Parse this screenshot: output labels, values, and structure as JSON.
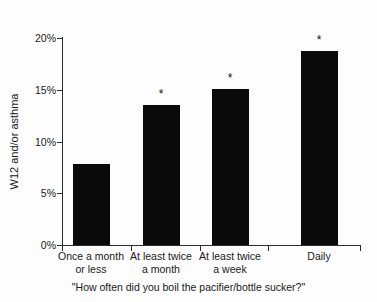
{
  "chart_data": {
    "type": "bar",
    "title": "",
    "subtitle": "",
    "categories": [
      "Once a month\nor less",
      "At least twice\na month",
      "At least twice\na week",
      "Daily"
    ],
    "values": [
      7.8,
      13.5,
      15.1,
      18.7
    ],
    "value_labels": [
      "7.8%",
      "13.5%",
      "15.1%",
      "18.7%"
    ],
    "annotations": [
      "",
      "*",
      "*",
      "*"
    ],
    "xlabel": "\"How often did you boil the pacifier/bottle sucker?\"",
    "ylabel": "W12 and/or asthma",
    "ylim": [
      0,
      20
    ],
    "yticks": [
      0,
      5,
      10,
      15,
      20
    ],
    "ytick_labels": [
      "0%",
      "5%",
      "10%",
      "15%",
      "20%"
    ],
    "grid": false,
    "legend": "none",
    "bar_color": "#0a0a0a",
    "axis_color": "#2b2b2b",
    "background_color": "#fdfdfd"
  }
}
